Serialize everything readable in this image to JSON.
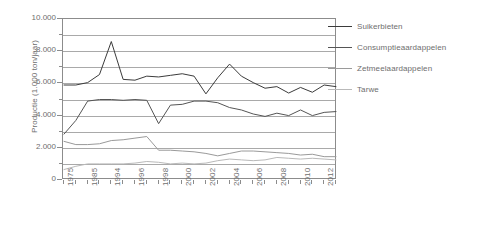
{
  "chart_data": {
    "type": "line",
    "title": "",
    "xlabel": "",
    "ylabel": "Productie (1.000 ton/jaar)",
    "ylim": [
      0,
      10000
    ],
    "y_ticks": [
      "0",
      "2.000",
      "4.000",
      "6.000",
      "8.000",
      "10.000"
    ],
    "y_tick_values": [
      0,
      2000,
      4000,
      6000,
      8000,
      10000
    ],
    "gridlines": [
      1000,
      2000,
      3000,
      4000,
      5000,
      6000,
      7000,
      8000,
      9000
    ],
    "grid": true,
    "legend_position": "right",
    "x": [
      1975,
      1980,
      1985,
      1990,
      1994,
      1995,
      1996,
      1997,
      1998,
      1999,
      2000,
      2001,
      2002,
      2003,
      2004,
      2005,
      2006,
      2007,
      2008,
      2009,
      2010,
      2011,
      2012,
      2013
    ],
    "x_tick_labels": [
      "1975",
      "1985",
      "1994",
      "1996",
      "1998",
      "2000",
      "2002",
      "2004",
      "2006",
      "2008",
      "2010",
      "2012"
    ],
    "x_tick_label_indices": [
      0,
      2,
      4,
      6,
      8,
      10,
      12,
      14,
      16,
      18,
      20,
      22
    ],
    "series": [
      {
        "name": "Suikerbieten",
        "color": "#3b3b3b",
        "values": [
          5900,
          5900,
          6050,
          6550,
          8600,
          6250,
          6200,
          6450,
          6400,
          6500,
          6600,
          6450,
          5350,
          6350,
          7200,
          6450,
          6050,
          5700,
          5800,
          5400,
          5750,
          5450,
          5900,
          5800
        ]
      },
      {
        "name": "Consumptieaardappelen",
        "color": "#555555",
        "values": [
          2850,
          3700,
          4900,
          5000,
          5000,
          4950,
          5000,
          4950,
          3500,
          4650,
          4700,
          4900,
          4900,
          4800,
          4500,
          4350,
          4100,
          3950,
          4150,
          4000,
          4350,
          4000,
          4200,
          4250
        ]
      },
      {
        "name": "Zetmeelaardappelen",
        "color": "#9a9a9a",
        "values": [
          2400,
          2200,
          2200,
          2250,
          2450,
          2500,
          2600,
          2700,
          1850,
          1850,
          1800,
          1750,
          1650,
          1500,
          1650,
          1800,
          1800,
          1750,
          1700,
          1650,
          1550,
          1600,
          1450,
          1450
        ]
      },
      {
        "name": "Tarwe",
        "color": "#b9b9b9",
        "values": [
          650,
          850,
          1000,
          1000,
          1000,
          1000,
          1050,
          1150,
          1100,
          1000,
          1050,
          1000,
          1050,
          1200,
          1300,
          1250,
          1200,
          1250,
          1400,
          1350,
          1300,
          1350,
          1300,
          1250
        ]
      }
    ]
  },
  "legend": {
    "items": [
      {
        "label": "Suikerbieten",
        "color": "#3b3b3b"
      },
      {
        "label": "Consumptieaardappelen",
        "color": "#555555"
      },
      {
        "label": "Zetmeelaardappelen",
        "color": "#9a9a9a"
      },
      {
        "label": "Tarwe",
        "color": "#b9b9b9"
      }
    ]
  },
  "axis": {
    "y_title": "Productie (1.000 ton/jaar)"
  }
}
